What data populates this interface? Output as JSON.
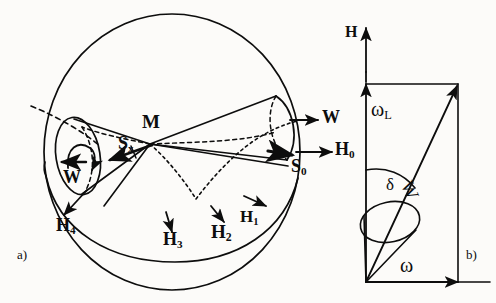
{
  "figure": {
    "background_color": "#fcfbf9",
    "ink_color": "#0d0d0d",
    "panels": [
      {
        "tag": "a)",
        "name": "panel-a-sphere-cones"
      },
      {
        "tag": "b)",
        "name": "panel-b-vector-diagram"
      }
    ]
  },
  "panel_a": {
    "caption": "a)",
    "center_label": "M",
    "spin_label": "S",
    "spin_sub": "x",
    "s_zero_label": "S",
    "s_zero_sub": "0",
    "field_label": "H",
    "field_sub": "0",
    "omega_right_label": "W",
    "omega_left_label": "W",
    "h_labels": [
      {
        "base": "H",
        "sub": "1"
      },
      {
        "base": "H",
        "sub": "2"
      },
      {
        "base": "H",
        "sub": "3"
      },
      {
        "base": "H",
        "sub": "4"
      }
    ]
  },
  "panel_b": {
    "caption": "b)",
    "axis_label": "H",
    "omega_l_label": "ω",
    "omega_l_sub": "L",
    "omega_label": "ω",
    "w_label": "W",
    "delta_label": "δ"
  }
}
